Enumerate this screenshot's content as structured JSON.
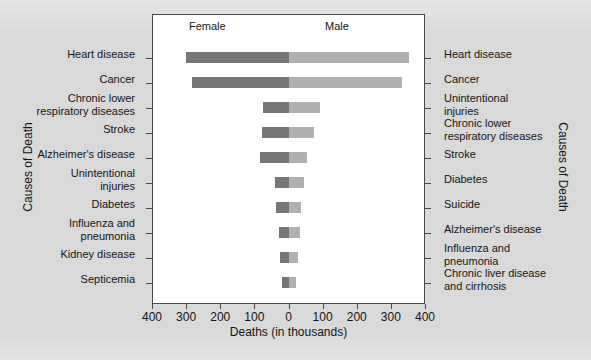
{
  "chart_data": {
    "type": "bar",
    "title": "",
    "subtitle": "",
    "orientation": "horizontal-bilateral",
    "xlabel": "Deaths (in thousands)",
    "ylabel_left": "Causes of Death",
    "ylabel_right": "Causes of Death",
    "panel_titles": {
      "left": "Female",
      "right": "Male"
    },
    "xlim": [
      -400,
      400
    ],
    "xticks": [
      400,
      300,
      200,
      100,
      0,
      100,
      200,
      300,
      400
    ],
    "grid": false,
    "legend": "none",
    "categories_left": [
      "Heart disease",
      "Cancer",
      "Chronic lower\nrespiratory diseases",
      "Stroke",
      "Alzheimer's disease",
      "Unintentional\ninjuries",
      "Diabetes",
      "Influenza and\npneumonia",
      "Kidney disease",
      "Septicemia"
    ],
    "categories_right": [
      "Heart disease",
      "Cancer",
      "Unintentional\ninjuries",
      "Chronic lower\nrespiratory diseases",
      "Stroke",
      "Diabetes",
      "Suicide",
      "Alzheimer's disease",
      "Influenza and\npneumonia",
      "Chronic liver disease\nand cirrhosis"
    ],
    "series": [
      {
        "name": "Female",
        "color": "#767676",
        "values": [
          301,
          282,
          75,
          77,
          84,
          41,
          36,
          29,
          24,
          20
        ]
      },
      {
        "name": "Male",
        "color": "#b0b0b0",
        "values": [
          353,
          332,
          91,
          74,
          55,
          44,
          36,
          34,
          27,
          21
        ]
      }
    ],
    "rows": [
      {
        "female_label": "Heart disease",
        "female": 301,
        "male_label": "Heart disease",
        "male": 353
      },
      {
        "female_label": "Cancer",
        "female": 282,
        "male_label": "Cancer",
        "male": 332
      },
      {
        "female_label": "Chronic lower\nrespiratory diseases",
        "female": 75,
        "male_label": "Unintentional\ninjuries",
        "male": 91
      },
      {
        "female_label": "Stroke",
        "female": 77,
        "male_label": "Chronic lower\nrespiratory diseases",
        "male": 74
      },
      {
        "female_label": "Alzheimer's disease",
        "female": 84,
        "male_label": "Stroke",
        "male": 55
      },
      {
        "female_label": "Unintentional\ninjuries",
        "female": 41,
        "male_label": "Diabetes",
        "male": 44
      },
      {
        "female_label": "Diabetes",
        "female": 36,
        "male_label": "Suicide",
        "male": 36
      },
      {
        "female_label": "Influenza and\npneumonia",
        "female": 29,
        "male_label": "Alzheimer's disease",
        "male": 34
      },
      {
        "female_label": "Kidney disease",
        "female": 24,
        "male_label": "Influenza and\npneumonia",
        "male": 27
      },
      {
        "female_label": "Septicemia",
        "female": 20,
        "male_label": "Chronic liver disease\nand cirrhosis",
        "male": 21
      }
    ],
    "colors": {
      "female_bar": "#767676",
      "male_bar": "#b0b0b0",
      "panel_background": "#ffffff",
      "figure_background": "#d9d9d9",
      "axis": "#4a4a4a",
      "text": "#151515"
    }
  }
}
